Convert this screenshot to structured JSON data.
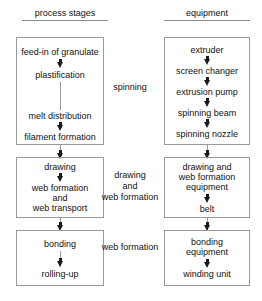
{
  "diagram": {
    "background_color": "#ffffff",
    "text_color": "#111111",
    "box_border_color": "#9a9a9a",
    "arrow_color": "#1a1a1a"
  },
  "headers": {
    "process": "process stages",
    "equipment": "equipment"
  },
  "process_stages": [
    {
      "id": "spinning",
      "nodes": [
        "feed-in of granulate",
        "plastification",
        "melt distribution",
        "filament formation"
      ]
    },
    {
      "id": "drawing",
      "nodes": [
        "drawing",
        "web formation",
        "and",
        "web transport"
      ]
    },
    {
      "id": "bonding",
      "nodes": [
        "bonding",
        "rolling-up"
      ]
    }
  ],
  "equipment_stages": [
    {
      "id": "spinning",
      "nodes": [
        "extruder",
        "screen changer",
        "extrusion pump",
        "spinning beam",
        "spinning nozzle"
      ]
    },
    {
      "id": "drawing",
      "nodes": [
        "drawing and",
        "web formation",
        "equipment",
        "belt"
      ]
    },
    {
      "id": "bonding",
      "nodes": [
        "bonding",
        "equipment",
        "winding unit"
      ]
    }
  ],
  "middle_labels": [
    {
      "id": "spinning",
      "lines": [
        "spinning"
      ]
    },
    {
      "id": "drawing",
      "lines": [
        "drawing",
        "and",
        "web formation"
      ]
    },
    {
      "id": "bonding",
      "lines": [
        "web formation"
      ]
    }
  ],
  "left_nodes": {
    "feed_in": "feed-in of granulate",
    "plastification": "plastification",
    "melt_distribution": "melt distribution",
    "filament_formation": "filament formation",
    "drawing": "drawing",
    "web_formation": "web formation",
    "and": "and",
    "web_transport": "web transport",
    "bonding": "bonding",
    "rolling_up": "rolling-up"
  },
  "right_nodes": {
    "extruder": "extruder",
    "screen_changer": "screen changer",
    "extrusion_pump": "extrusion pump",
    "spinning_beam": "spinning beam",
    "spinning_nozzle": "spinning nozzle",
    "drawing_and": "drawing and",
    "web_formation": "web formation",
    "equipment": "equipment",
    "belt": "belt",
    "bonding": "bonding",
    "bonding_equipment": "equipment",
    "winding_unit": "winding unit"
  },
  "middle": {
    "spinning": "spinning",
    "drawing": "drawing",
    "and": "and",
    "web_formation": "web formation",
    "bonding_web_formation": "web formation"
  }
}
